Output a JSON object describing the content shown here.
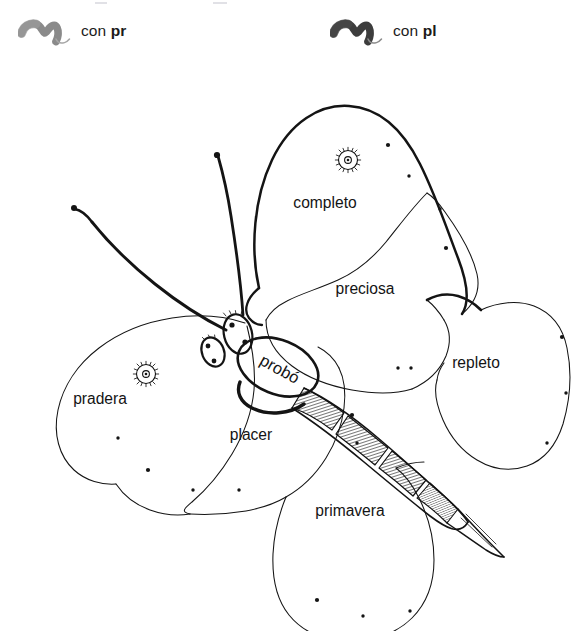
{
  "worksheet": {
    "title": "",
    "background_color": "#ffffff",
    "ink_color": "#141414"
  },
  "legend": {
    "items": [
      {
        "marker": "brush-stroke-gray",
        "marker_color": "#8a8a8a",
        "prefix": "con ",
        "cluster": "pr",
        "full_text": "con pr"
      },
      {
        "marker": "brush-stroke-dark",
        "marker_color": "#3d3d3d",
        "prefix": "con ",
        "cluster": "pl",
        "full_text": "con pl"
      }
    ]
  },
  "figure": {
    "body_label": "probó",
    "wings": [
      {
        "id": "upper-left",
        "label": "completo",
        "cluster": "pl",
        "x": 325,
        "y": 156
      },
      {
        "id": "mid-right",
        "label": "preciosa",
        "cluster": "pr",
        "x": 365,
        "y": 242
      },
      {
        "id": "right",
        "label": "repleto",
        "cluster": "pl",
        "x": 476,
        "y": 316
      },
      {
        "id": "lower-left",
        "label": "pradera",
        "cluster": "pr",
        "x": 100,
        "y": 352
      },
      {
        "id": "lower-mid",
        "label": "placer",
        "cluster": "pl",
        "x": 251,
        "y": 388
      },
      {
        "id": "bottom",
        "label": "primavera",
        "cluster": "pr",
        "x": 350,
        "y": 464
      }
    ],
    "eyespots": [
      {
        "cx": 348,
        "cy": 108,
        "r": 9
      },
      {
        "cx": 146,
        "cy": 322,
        "r": 9
      }
    ],
    "antennae": 2,
    "wing_dots": [
      {
        "x": 388,
        "y": 93
      },
      {
        "x": 409,
        "y": 124
      },
      {
        "x": 440,
        "y": 157
      },
      {
        "x": 446,
        "y": 196
      },
      {
        "x": 398,
        "y": 316
      },
      {
        "x": 411,
        "y": 316
      },
      {
        "x": 562,
        "y": 285
      },
      {
        "x": 566,
        "y": 341
      },
      {
        "x": 547,
        "y": 391
      },
      {
        "x": 352,
        "y": 363
      },
      {
        "x": 357,
        "y": 391
      },
      {
        "x": 118,
        "y": 386
      },
      {
        "x": 148,
        "y": 418
      },
      {
        "x": 193,
        "y": 438
      },
      {
        "x": 239,
        "y": 438
      },
      {
        "x": 317,
        "y": 548
      },
      {
        "x": 363,
        "y": 564
      },
      {
        "x": 410,
        "y": 559
      }
    ]
  }
}
